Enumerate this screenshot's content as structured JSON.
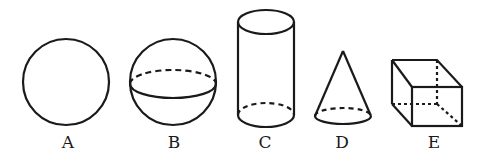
{
  "figure": {
    "stroke_color": "#1a1a1a",
    "background": "#ffffff",
    "shapes": [
      {
        "id": "A",
        "label": "A",
        "kind": "circle"
      },
      {
        "id": "B",
        "label": "B",
        "kind": "sphere"
      },
      {
        "id": "C",
        "label": "C",
        "kind": "cylinder"
      },
      {
        "id": "D",
        "label": "D",
        "kind": "cone"
      },
      {
        "id": "E",
        "label": "E",
        "kind": "cube"
      }
    ]
  }
}
